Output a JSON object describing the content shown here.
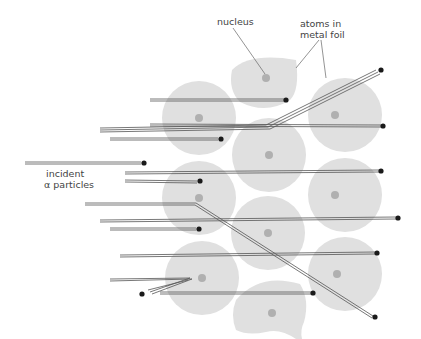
{
  "labels": {
    "nucleus": "nucleus",
    "atoms_line1": "atoms in",
    "atoms_line2": "metal foil",
    "incident_line1": "incident",
    "incident_line2": "α particles"
  },
  "colors": {
    "atom": "#e0e0e0",
    "nucleus": "#b0b0b0",
    "track": "#555555",
    "particle": "#1a1a1a",
    "leader": "#666666"
  },
  "atoms": [
    {
      "cx": 266,
      "cy": 78
    },
    {
      "cx": 199,
      "cy": 118
    },
    {
      "cx": 345,
      "cy": 115
    },
    {
      "cx": 269,
      "cy": 155
    },
    {
      "cx": 199,
      "cy": 198
    },
    {
      "cx": 345,
      "cy": 195
    },
    {
      "cx": 268,
      "cy": 233
    },
    {
      "cx": 202,
      "cy": 278
    },
    {
      "cx": 345,
      "cy": 274
    },
    {
      "cx": 272,
      "cy": 313
    }
  ],
  "particles": [
    {
      "x": 286,
      "y": 99
    },
    {
      "x": 381,
      "y": 70
    },
    {
      "x": 221,
      "y": 138
    },
    {
      "x": 383,
      "y": 126
    },
    {
      "x": 144,
      "y": 162
    },
    {
      "x": 200,
      "y": 180
    },
    {
      "x": 381,
      "y": 170
    },
    {
      "x": 199,
      "y": 228
    },
    {
      "x": 398,
      "y": 217
    },
    {
      "x": 377,
      "y": 252
    },
    {
      "x": 142,
      "y": 294
    },
    {
      "x": 313,
      "y": 292
    },
    {
      "x": 375,
      "y": 316
    }
  ]
}
